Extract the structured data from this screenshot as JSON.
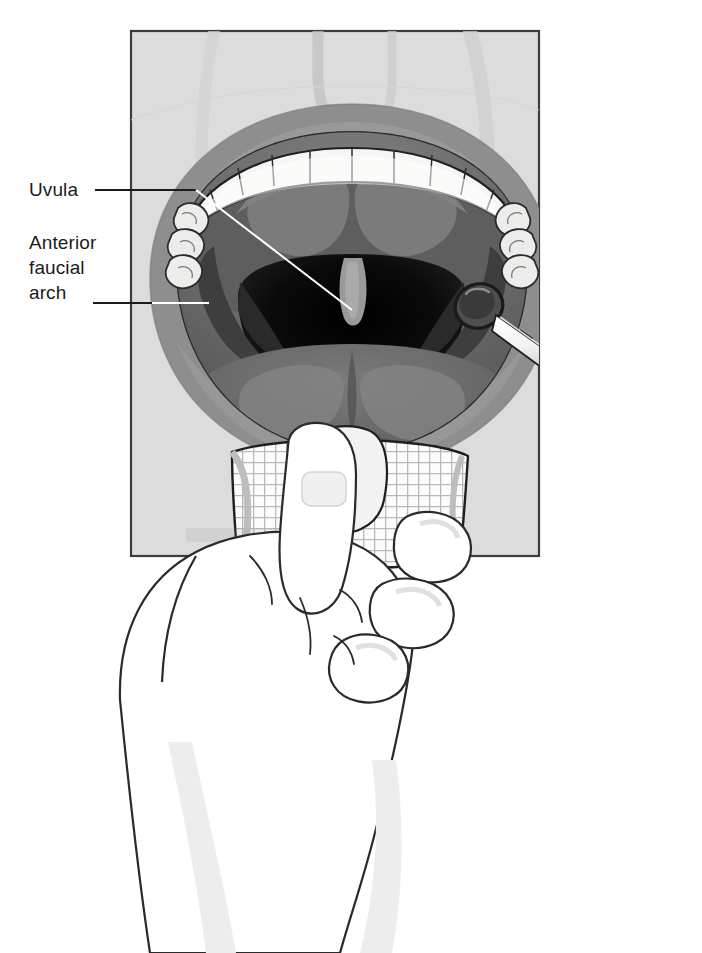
{
  "figure": {
    "name": "oral-pharyngeal-examination",
    "orientation": "portrait",
    "rendering": "grayscale medical line illustration"
  },
  "labels": {
    "uvula": {
      "text": "Uvula",
      "lines": [
        "Uvula"
      ],
      "leader": "horizontal line from label to uvula tip"
    },
    "anterior_faucial_arch": {
      "text": "Anterior faucial arch",
      "lines": [
        "Anterior",
        "faucial",
        "arch"
      ],
      "leader": "horizontal line from third line to anterior faucial arch"
    }
  },
  "anatomy": [
    {
      "name": "upper-lip",
      "tone": "#8e8e8e"
    },
    {
      "name": "upper-teeth",
      "tone": "#f4f4f2",
      "count": 14
    },
    {
      "name": "hard-palate",
      "tone": "#6f6f6f"
    },
    {
      "name": "soft-palate",
      "tone": "#5e5e5e"
    },
    {
      "name": "uvula",
      "tone": "#9a9a9a"
    },
    {
      "name": "anterior-faucial-arch",
      "tone": "#4a4a4a"
    },
    {
      "name": "posterior-pharyngeal-wall",
      "tone": "#111111"
    },
    {
      "name": "tonsil-left",
      "tone": "#3a3a3a"
    },
    {
      "name": "tonsil-right",
      "tone": "#3a3a3a"
    },
    {
      "name": "tongue-dorsum",
      "tone": "#6a6a6a"
    },
    {
      "name": "lower-lip",
      "tone": "#8e8e8e"
    },
    {
      "name": "nose-outline",
      "tone": "#d0d0d0"
    }
  ],
  "instruments": [
    {
      "name": "dental-mirror",
      "parts": [
        "mirror-head",
        "shank",
        "handle"
      ],
      "tone": "#c9c9c9"
    },
    {
      "name": "gauze-square",
      "tone": "#fbfbfb",
      "pattern": "woven grid"
    }
  ],
  "hand": {
    "name": "examiner-hand",
    "description": "hand gripping gauze-wrapped tongue",
    "digits": [
      "thumb",
      "index-finger",
      "middle-finger",
      "ring-finger"
    ],
    "outline_color": "#2a2a2a",
    "fill": "#ffffff"
  },
  "panel": {
    "name": "illustration-panel",
    "border_color": "#3c3c3c",
    "background": "#dcdcdc",
    "x": 131,
    "y": 31,
    "width": 408,
    "height": 525
  },
  "colors": {
    "ink": "#1b1b1b",
    "leader": "#ffffff",
    "leader_outside": "#1b1b1b",
    "panel_bg": "#dcdcdc",
    "panel_border": "#3c3c3c",
    "page_bg": "#ffffff"
  }
}
